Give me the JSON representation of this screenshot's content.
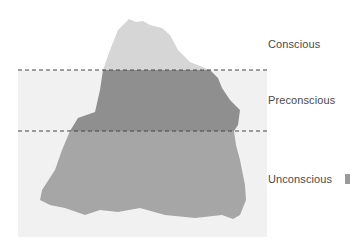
{
  "diagram": {
    "type": "iceberg",
    "labels": {
      "conscious": "Conscious",
      "preconscious": "Preconscious",
      "unconscious": "Unconscious"
    },
    "colors": {
      "page_background": "#ffffff",
      "water_panel": "#f1f1f1",
      "conscious_fill": "#d6d6d6",
      "preconscious_fill": "#8f8f8f",
      "unconscious_fill": "#a6a6a6",
      "divider_line": "#444444",
      "label_text": "#4a4a4a"
    },
    "dividers": [
      {
        "name": "conscious-preconscious",
        "y": 70
      },
      {
        "name": "preconscious-unconscious",
        "y": 131
      }
    ]
  }
}
